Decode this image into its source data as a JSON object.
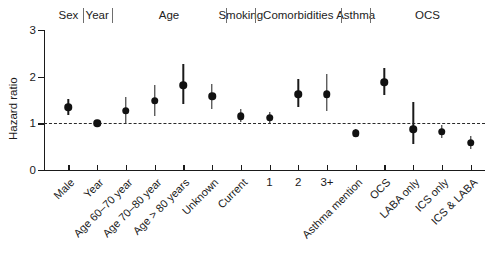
{
  "chart_data": {
    "type": "scatter",
    "title": "",
    "xlabel": "",
    "ylabel": "Hazard ratio",
    "ylim": [
      0,
      3
    ],
    "yticks": [
      0,
      1,
      2,
      3
    ],
    "ytick_labels": [
      "0",
      "1",
      "2",
      "3"
    ],
    "grid": false,
    "legend": "none",
    "reference_line": 1,
    "reference_line_style": "dashed",
    "categories": [
      "Male",
      "Year",
      "Age 60–70 year",
      "Age 70–80 year",
      "Age > 80 years",
      "Unknown",
      "Current",
      "1",
      "2",
      "3+",
      "Asthma mention",
      "OCS",
      "LABA only",
      "ICS only",
      "ICS & LABA"
    ],
    "values": [
      1.35,
      1.0,
      1.27,
      1.48,
      1.82,
      1.58,
      1.15,
      1.12,
      1.62,
      1.62,
      0.79,
      1.88,
      0.87,
      0.82,
      0.58
    ],
    "ci_low": [
      1.18,
      0.96,
      1.0,
      1.15,
      1.42,
      1.3,
      1.02,
      1.0,
      1.35,
      1.26,
      0.72,
      1.6,
      0.55,
      0.68,
      0.45
    ],
    "ci_high": [
      1.52,
      1.04,
      1.57,
      1.82,
      2.28,
      1.85,
      1.3,
      1.24,
      1.96,
      2.06,
      0.87,
      2.18,
      1.45,
      0.96,
      0.73
    ],
    "groups": [
      {
        "label": "Sex",
        "start": 0,
        "end": 0
      },
      {
        "label": "Year",
        "start": 1,
        "end": 1
      },
      {
        "label": "Age",
        "start": 2,
        "end": 5
      },
      {
        "label": "Smoking",
        "start": 6,
        "end": 6
      },
      {
        "label": "Comorbidities",
        "start": 7,
        "end": 9
      },
      {
        "label": "Asthma",
        "start": 10,
        "end": 10
      },
      {
        "label": "OCS",
        "start": 11,
        "end": 14
      }
    ]
  }
}
